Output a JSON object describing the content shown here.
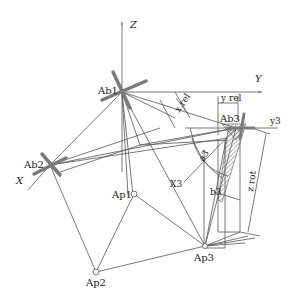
{
  "diagram": {
    "axes": {
      "z": "Z",
      "y": "Y",
      "x": "X",
      "y3": "y3",
      "x3": "X3"
    },
    "nodes": {
      "ab1": "Ab1",
      "ab2": "Ab2",
      "ab3": "Ab3",
      "ap1": "Ap1",
      "ap2": "Ap2",
      "ap3": "Ap3"
    },
    "dimensions": {
      "x_rel": "x rel",
      "y_rel": "y rel",
      "z_rot": "z rot",
      "a3": "a3",
      "b3": "b3"
    },
    "colors": {
      "line": "#555555",
      "thick": "#7a7a7a",
      "hatch": "#666666"
    }
  }
}
